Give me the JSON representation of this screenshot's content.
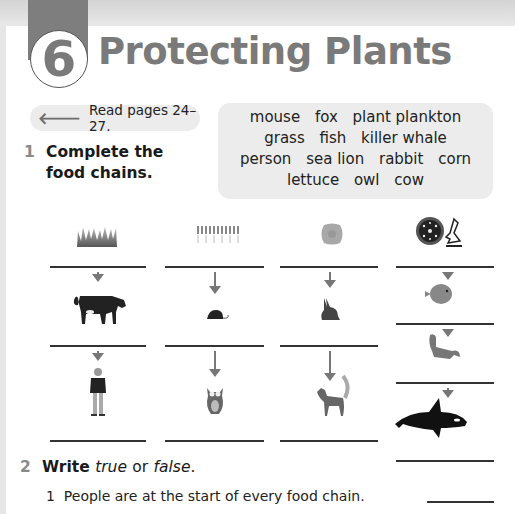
{
  "chapter": {
    "number": "6",
    "title": "Protecting Plants"
  },
  "read_hint": {
    "icon": "left-arrow-icon",
    "text": "Read pages 24–27."
  },
  "word_bank": {
    "lines": [
      [
        "mouse",
        "fox",
        "plant plankton"
      ],
      [
        "grass",
        "fish",
        "killer whale"
      ],
      [
        "person",
        "sea lion",
        "rabbit",
        "corn"
      ],
      [
        "lettuce",
        "owl",
        "cow"
      ]
    ]
  },
  "exercise1": {
    "number": "1",
    "instruction_line1": "Complete the",
    "instruction_line2": "food chains.",
    "chains": [
      {
        "pictures": [
          "grass",
          "cow",
          "person"
        ]
      },
      {
        "pictures": [
          "corn",
          "mouse",
          "owl"
        ]
      },
      {
        "pictures": [
          "lettuce",
          "rabbit",
          "fox"
        ]
      },
      {
        "pictures": [
          "plant plankton",
          "fish",
          "sea lion",
          "killer whale"
        ]
      }
    ]
  },
  "exercise2": {
    "number": "2",
    "instruction_write": "Write",
    "instruction_true": "true",
    "instruction_or": "or",
    "instruction_false": "false",
    "instruction_end": ".",
    "statements": [
      {
        "number": "1",
        "text": "People are at the start of every food chain."
      }
    ]
  }
}
